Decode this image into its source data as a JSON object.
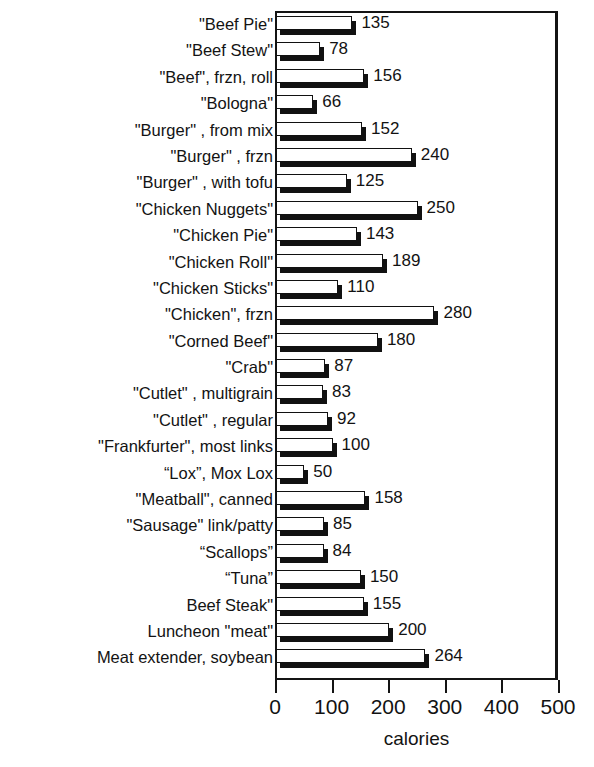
{
  "chart_data": {
    "type": "bar",
    "orientation": "horizontal",
    "title": "VEGETARIAN FOODS",
    "title_note": "title is cropped off the top edge of the screenshot; only the bottom tips of the letters are visible",
    "xlabel": "calories",
    "ylabel": "",
    "xlim": [
      0,
      500
    ],
    "xticks": [
      0,
      100,
      200,
      300,
      400,
      500
    ],
    "xticklabels": [
      "0",
      "100",
      "200",
      "300",
      "400",
      "500"
    ],
    "grid": false,
    "legend": false,
    "bar_style": {
      "fill": "#ffffff",
      "outline": "#111111",
      "shadow": "#111111",
      "shadow_offset_px": 4
    },
    "categories": [
      "\"Beef Pie\"",
      "\"Beef Stew\"",
      "\"Beef\", frzn, roll",
      "\"Bologna\"",
      "\"Burger\" , from mix",
      "\"Burger\" , frzn",
      "\"Burger\" , with tofu",
      "\"Chicken Nuggets\"",
      "\"Chicken Pie\"",
      "\"Chicken Roll\"",
      "\"Chicken Sticks\"",
      "\"Chicken\", frzn",
      "\"Corned Beef\"",
      "\"Crab\"",
      "\"Cutlet\" , multigrain",
      "\"Cutlet\" , regular",
      "\"Frankfurter\", most links",
      "“Lox”, Mox Lox",
      "\"Meatball\", canned",
      "\"Sausage\" link/patty",
      "“Scallops”",
      "“Tuna”",
      "Beef Steak\"",
      "Luncheon \"meat\"",
      "Meat extender, soybean"
    ],
    "values": [
      135,
      78,
      156,
      66,
      152,
      240,
      125,
      250,
      143,
      189,
      110,
      280,
      180,
      87,
      83,
      92,
      100,
      50,
      158,
      85,
      84,
      150,
      155,
      200,
      264
    ],
    "value_labels": [
      "135",
      "78",
      "156",
      "66",
      "152",
      "240",
      "125",
      "250",
      "143",
      "189",
      "110",
      "280",
      "180",
      "87",
      "83",
      "92",
      "100",
      "50",
      "158",
      "85",
      "84",
      "150",
      "155",
      "200",
      "264"
    ]
  }
}
